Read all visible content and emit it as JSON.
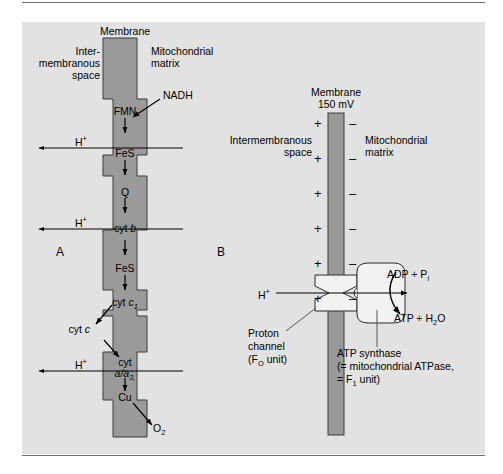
{
  "figure": {
    "background_color": "#e2e2e2",
    "membrane_color": "#9a9a9a",
    "rule_color": "#6f6f6f",
    "page_color": "#ffffff"
  },
  "panel_a": {
    "letter": "A",
    "membrane_title": "Membrane",
    "left_compartment_line1": "Inter-",
    "left_compartment_line2": "membranous",
    "left_compartment_line3": "space",
    "right_compartment_line1": "Mitochondrial",
    "right_compartment_line2": "matrix",
    "substrate": "NADH",
    "product": "O",
    "product_sub": "2",
    "carriers": [
      {
        "label": "FMN",
        "italic_part": ""
      },
      {
        "label": "FeS",
        "italic_part": ""
      },
      {
        "label": "Q",
        "italic_part": ""
      },
      {
        "label": "cyt ",
        "italic_part": "b"
      },
      {
        "label": "FeS",
        "italic_part": ""
      },
      {
        "label": "cyt ",
        "italic_part": "c",
        "italic_sub": "1"
      },
      {
        "label": "cyt ",
        "italic_part": "c"
      },
      {
        "label": "cyt",
        "italic_part": "a/a",
        "italic_sub": "3,"
      },
      {
        "label": "Cu",
        "italic_part": ""
      }
    ],
    "proton_label": "H",
    "proton_charge": "+",
    "proton_pump_count": 3
  },
  "panel_b": {
    "letter": "B",
    "membrane_title": "Membrane",
    "membrane_potential": "150 mV",
    "left_compartment_line1": "Intermembranous",
    "left_compartment_line2": "space",
    "right_compartment_line1": "Mitochondrial",
    "right_compartment_line2": "matrix",
    "positive_sign": "+",
    "negative_sign": "–",
    "charge_pair_count": 6,
    "proton_label": "H",
    "proton_charge": "+",
    "substrate_text": "ADP + P",
    "substrate_sub": "i",
    "product_text": "ATP + H",
    "product_sub": "2",
    "product_tail": "O",
    "channel_label_line1": "Proton",
    "channel_label_line2": "channel",
    "channel_label_line3a": "(F",
    "channel_label_line3b": "O",
    "channel_label_line3c": " unit)",
    "synthase_label_line1": "ATP synthase",
    "synthase_label_line2": "(= mitochondrial ATPase,",
    "synthase_label_line3a": "= F",
    "synthase_label_line3b": "1",
    "synthase_label_line3c": " unit)"
  }
}
